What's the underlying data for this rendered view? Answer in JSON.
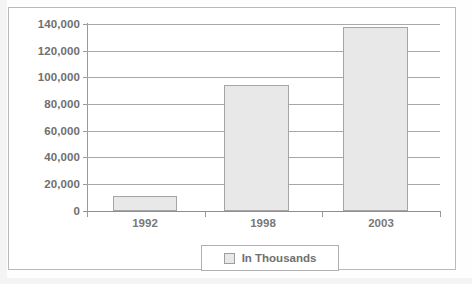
{
  "chart_data": {
    "type": "bar",
    "title": "",
    "xlabel": "",
    "ylabel": "",
    "categories": [
      "1992",
      "1998",
      "2003"
    ],
    "values": [
      11000,
      94500,
      137500
    ],
    "series": [
      {
        "name": "In Thousands",
        "values": [
          11000,
          94500,
          137500
        ]
      }
    ],
    "ylim": [
      0,
      140000
    ],
    "y_tick_values": [
      140000,
      120000,
      100000,
      80000,
      60000,
      40000,
      20000,
      0
    ],
    "y_tick_labels": [
      "140,000",
      "120,000",
      "100,000",
      "80,000",
      "60,000",
      "40,000",
      "20,000",
      "0"
    ],
    "grid": true,
    "legend_position": "bottom",
    "legend_entries": [
      "In Thousands"
    ],
    "colors": {
      "bar_fill": "#e8e8e8",
      "bar_border": "#a5a5a5",
      "gridline": "#a8a8a8",
      "axis": "#9a9a9a",
      "text": "#6f6f6f",
      "frame": "#b9b9b9",
      "background": "#ffffff"
    }
  },
  "legend": {
    "label": "In Thousands",
    "swatch_name": "legend-color-swatch"
  }
}
